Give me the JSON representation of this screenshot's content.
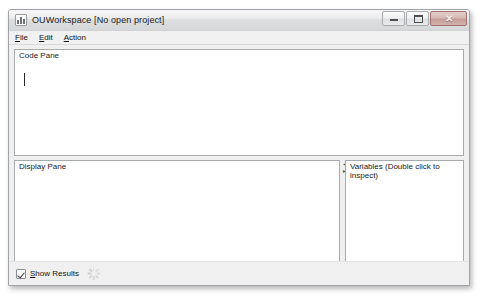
{
  "window": {
    "title": "OUWorkspace [No open project]",
    "icon": "chart-app-icon",
    "controls": {
      "minimize": "–",
      "maximize": "□",
      "close": "✕"
    }
  },
  "menubar": {
    "items": [
      {
        "mnemonic": "F",
        "rest": "ile",
        "name": "file"
      },
      {
        "mnemonic": "E",
        "rest": "dit",
        "name": "edit"
      },
      {
        "mnemonic": "A",
        "rest": "ction",
        "name": "action"
      }
    ]
  },
  "panes": {
    "code": {
      "title": "Code Pane",
      "content": ""
    },
    "display": {
      "title": "Display Pane",
      "content": ""
    },
    "variables": {
      "title": "Variables (Double click to inspect)",
      "content": ""
    }
  },
  "statusbar": {
    "show_results": {
      "checked": true,
      "mnemonic": "S",
      "rest": "how Results"
    },
    "spinner": "busy-spinner-icon"
  }
}
